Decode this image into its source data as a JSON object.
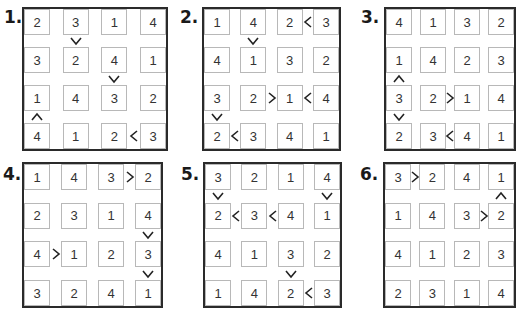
{
  "puzzles": [
    {
      "label": "1.",
      "grid": [
        [
          2,
          3,
          1,
          4
        ],
        [
          3,
          2,
          4,
          1
        ],
        [
          1,
          4,
          3,
          2
        ],
        [
          4,
          1,
          2,
          3
        ]
      ],
      "h_signs": [
        {
          "r": 3,
          "c": 2,
          "sign": "<"
        }
      ],
      "v_signs": [
        {
          "r": 0,
          "c": 1,
          "sign": "v"
        },
        {
          "r": 1,
          "c": 2,
          "sign": "v"
        },
        {
          "r": 2,
          "c": 0,
          "sign": "^"
        }
      ]
    },
    {
      "label": "2.",
      "grid": [
        [
          1,
          4,
          2,
          3
        ],
        [
          4,
          1,
          3,
          2
        ],
        [
          3,
          2,
          1,
          4
        ],
        [
          2,
          3,
          4,
          1
        ]
      ],
      "h_signs": [
        {
          "r": 0,
          "c": 2,
          "sign": "<"
        },
        {
          "r": 2,
          "c": 1,
          "sign": ">"
        },
        {
          "r": 2,
          "c": 2,
          "sign": "<"
        },
        {
          "r": 3,
          "c": 0,
          "sign": "<"
        }
      ],
      "v_signs": [
        {
          "r": 0,
          "c": 1,
          "sign": "v"
        },
        {
          "r": 2,
          "c": 0,
          "sign": "v"
        }
      ]
    },
    {
      "label": "3.",
      "grid": [
        [
          4,
          1,
          3,
          2
        ],
        [
          1,
          4,
          2,
          3
        ],
        [
          3,
          2,
          1,
          4
        ],
        [
          2,
          3,
          4,
          1
        ]
      ],
      "h_signs": [
        {
          "r": 2,
          "c": 1,
          "sign": ">"
        },
        {
          "r": 3,
          "c": 1,
          "sign": "<"
        }
      ],
      "v_signs": [
        {
          "r": 1,
          "c": 0,
          "sign": "^"
        },
        {
          "r": 2,
          "c": 0,
          "sign": "v"
        }
      ]
    },
    {
      "label": "4.",
      "grid": [
        [
          1,
          4,
          3,
          2
        ],
        [
          2,
          3,
          1,
          4
        ],
        [
          4,
          1,
          2,
          3
        ],
        [
          3,
          2,
          4,
          1
        ]
      ],
      "h_signs": [
        {
          "r": 0,
          "c": 2,
          "sign": ">"
        },
        {
          "r": 2,
          "c": 0,
          "sign": ">"
        }
      ],
      "v_signs": [
        {
          "r": 1,
          "c": 3,
          "sign": "v"
        },
        {
          "r": 2,
          "c": 3,
          "sign": "v"
        }
      ]
    },
    {
      "label": "5.",
      "grid": [
        [
          3,
          2,
          1,
          4
        ],
        [
          2,
          3,
          4,
          1
        ],
        [
          4,
          1,
          3,
          2
        ],
        [
          1,
          4,
          2,
          3
        ]
      ],
      "h_signs": [
        {
          "r": 1,
          "c": 0,
          "sign": "<"
        },
        {
          "r": 1,
          "c": 1,
          "sign": "<"
        },
        {
          "r": 3,
          "c": 2,
          "sign": "<"
        }
      ],
      "v_signs": [
        {
          "r": 0,
          "c": 0,
          "sign": "v"
        },
        {
          "r": 0,
          "c": 3,
          "sign": "v"
        },
        {
          "r": 2,
          "c": 2,
          "sign": "v"
        }
      ]
    },
    {
      "label": "6.",
      "grid": [
        [
          3,
          2,
          4,
          1
        ],
        [
          1,
          4,
          3,
          2
        ],
        [
          4,
          1,
          2,
          3
        ],
        [
          2,
          3,
          1,
          4
        ]
      ],
      "h_signs": [
        {
          "r": 0,
          "c": 0,
          "sign": ">"
        },
        {
          "r": 1,
          "c": 2,
          "sign": ">"
        }
      ],
      "v_signs": [
        {
          "r": 0,
          "c": 3,
          "sign": "^"
        }
      ]
    }
  ],
  "layout": [
    {
      "label_x": 4,
      "label_y": 9,
      "fx": 22,
      "fy": 7,
      "fw": 146,
      "fh": 144
    },
    {
      "label_x": 180,
      "label_y": 9,
      "fx": 202,
      "fy": 7,
      "fw": 139,
      "fh": 144
    },
    {
      "label_x": 361,
      "label_y": 9,
      "fx": 384,
      "fy": 7,
      "fw": 132,
      "fh": 144
    },
    {
      "label_x": 3,
      "label_y": 166,
      "fx": 22,
      "fy": 162,
      "fw": 141,
      "fh": 146
    },
    {
      "label_x": 181,
      "label_y": 166,
      "fx": 203,
      "fy": 162,
      "fw": 139,
      "fh": 146
    },
    {
      "label_x": 360,
      "label_y": 166,
      "fx": 383,
      "fy": 162,
      "fw": 133,
      "fh": 146
    }
  ]
}
